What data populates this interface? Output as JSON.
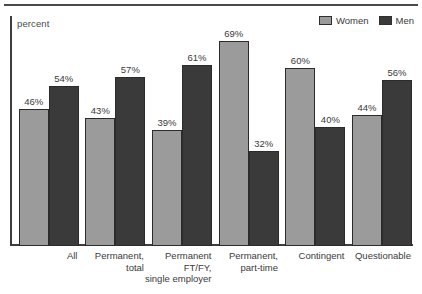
{
  "figure": {
    "y_axis_caption": "percent",
    "top_rule": true
  },
  "legend": {
    "entries": [
      {
        "label": "Women",
        "color": "#9b9b9b"
      },
      {
        "label": "Men",
        "color": "#3a3a3a"
      }
    ]
  },
  "chart_data": {
    "type": "bar",
    "title": "",
    "xlabel": "",
    "ylabel": "percent",
    "ylim": [
      0,
      72
    ],
    "grid": false,
    "legend_position": "top-right",
    "categories": [
      "All",
      "Permanent, total",
      "Permanent FT/FY, single employer",
      "Permanent, part-time",
      "Contingent",
      "Questionable"
    ],
    "category_label_lines": [
      [
        "All"
      ],
      [
        "Permanent,",
        "total"
      ],
      [
        "Permanent",
        "FT/FY,",
        "single employer"
      ],
      [
        "Permanent,",
        "part-time"
      ],
      [
        "Contingent"
      ],
      [
        "Questionable"
      ]
    ],
    "series": [
      {
        "name": "Women",
        "color": "#9b9b9b",
        "values": [
          46,
          43,
          39,
          69,
          60,
          44
        ]
      },
      {
        "name": "Men",
        "color": "#3a3a3a",
        "values": [
          54,
          57,
          61,
          32,
          40,
          56
        ]
      }
    ],
    "value_labels": [
      [
        "46%",
        "54%"
      ],
      [
        "43%",
        "57%"
      ],
      [
        "39%",
        "61%"
      ],
      [
        "69%",
        "32%"
      ],
      [
        "60%",
        "40%"
      ],
      [
        "44%",
        "56%"
      ]
    ]
  }
}
